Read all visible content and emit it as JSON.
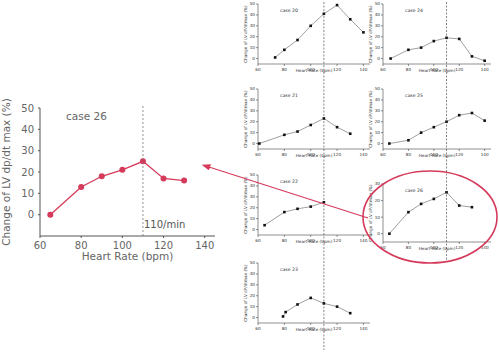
{
  "figure": {
    "accent_color": "#d63a5a",
    "small_chart_color": "#222222",
    "threshold_hr": 110
  },
  "chart_data": [
    {
      "id": "case26_large",
      "type": "line",
      "title": "case 26",
      "xlabel": "Heart Rate (bpm)",
      "ylabel": "Change of LV dp/dt max (%)",
      "xlim": [
        60,
        145
      ],
      "ylim": [
        -10,
        50
      ],
      "xticks": [
        60,
        80,
        100,
        120,
        140
      ],
      "yticks": [
        0,
        10,
        20,
        30,
        40,
        50
      ],
      "x": [
        65,
        80,
        90,
        100,
        110,
        120,
        130
      ],
      "values": [
        0,
        13,
        18,
        21,
        25,
        17,
        16
      ],
      "vline": 110,
      "annotation": "110/min",
      "grid": false,
      "color": "#d63a5a"
    },
    {
      "id": "case20",
      "type": "line",
      "title": "case 20",
      "xlabel": "Heart Rate (bpm)",
      "ylabel": "Change of LV dP/dtmax (%)",
      "xlim": [
        60,
        145
      ],
      "ylim": [
        -5,
        50
      ],
      "xticks": [
        60,
        80,
        100,
        120,
        140
      ],
      "yticks": [
        0,
        10,
        20,
        30,
        40,
        50
      ],
      "x": [
        73,
        80,
        90,
        100,
        110,
        120,
        130,
        140
      ],
      "values": [
        1,
        8,
        17,
        30,
        41,
        49,
        36,
        24
      ],
      "vline": 110
    },
    {
      "id": "case24",
      "type": "line",
      "title": "case 24",
      "xlabel": "Heart Rate (bpm)",
      "ylabel": "Change of LV dP/dtmax (%)",
      "xlim": [
        60,
        145
      ],
      "ylim": [
        -5,
        50
      ],
      "xticks": [
        60,
        80,
        100,
        120,
        140
      ],
      "yticks": [
        0,
        10,
        20,
        30,
        40,
        50
      ],
      "x": [
        66,
        80,
        90,
        100,
        110,
        120,
        130,
        140
      ],
      "values": [
        0,
        8,
        10,
        16,
        19,
        18,
        2,
        -2
      ],
      "vline": 110
    },
    {
      "id": "case21",
      "type": "line",
      "title": "case 21",
      "xlabel": "Heart Rate (bpm)",
      "ylabel": "Change of LV dP/dtmax (%)",
      "xlim": [
        60,
        145
      ],
      "ylim": [
        -5,
        50
      ],
      "xticks": [
        60,
        80,
        100,
        120,
        140
      ],
      "yticks": [
        0,
        10,
        20,
        30,
        40,
        50
      ],
      "x": [
        61,
        80,
        90,
        100,
        110,
        120,
        130
      ],
      "values": [
        0,
        8,
        11,
        17,
        23,
        15,
        9
      ],
      "vline": 110
    },
    {
      "id": "case25",
      "type": "line",
      "title": "case 25",
      "xlabel": "Heart Rate (bpm)",
      "ylabel": "Change of LV dP/dtmax (%)",
      "xlim": [
        60,
        145
      ],
      "ylim": [
        -5,
        50
      ],
      "xticks": [
        60,
        80,
        100,
        120,
        140
      ],
      "yticks": [
        0,
        10,
        20,
        30,
        40,
        50
      ],
      "x": [
        65,
        80,
        90,
        100,
        110,
        120,
        130,
        140
      ],
      "values": [
        0,
        3,
        10,
        15,
        20,
        26,
        28,
        21
      ],
      "vline": 110
    },
    {
      "id": "case22",
      "type": "line",
      "title": "case 22",
      "xlabel": "Heart Rate (bpm)",
      "ylabel": "Change of LV dP/dtmax (%)",
      "xlim": [
        60,
        145
      ],
      "ylim": [
        -5,
        50
      ],
      "xticks": [
        60,
        80,
        100,
        120,
        140
      ],
      "yticks": [
        0,
        10,
        20,
        30,
        40,
        50
      ],
      "x": [
        65,
        80,
        90,
        100,
        110
      ],
      "values": [
        4,
        16,
        19,
        21,
        25
      ],
      "vline": 110
    },
    {
      "id": "case26",
      "type": "line",
      "title": "case 26",
      "xlabel": "Heart Rate (bpm)",
      "ylabel": "Change of LV dP/dtmax (%)",
      "xlim": [
        60,
        145
      ],
      "ylim": [
        -5,
        30
      ],
      "xticks": [
        60,
        80,
        100,
        120,
        140
      ],
      "yticks": [
        0,
        10,
        20,
        30
      ],
      "x": [
        65,
        80,
        90,
        100,
        110,
        120,
        130
      ],
      "values": [
        0,
        13,
        18,
        21,
        25,
        17,
        16
      ],
      "vline": 110,
      "highlighted": true
    },
    {
      "id": "case23",
      "type": "line",
      "title": "case 23",
      "xlabel": "Heart Rate (bpm)",
      "ylabel": "Change of LV dP/dtmax (%)",
      "xlim": [
        60,
        145
      ],
      "ylim": [
        -5,
        50
      ],
      "xticks": [
        60,
        80,
        100,
        120,
        140
      ],
      "yticks": [
        0,
        10,
        20,
        30,
        40,
        50
      ],
      "x": [
        79,
        81,
        90,
        100,
        110,
        120,
        130
      ],
      "values": [
        1,
        5,
        12,
        18,
        13,
        10,
        4
      ],
      "vline": 110
    }
  ],
  "layout": {
    "large": {
      "left": 40,
      "top": 108,
      "width": 175,
      "height": 128,
      "label_color": "#666666"
    },
    "grid": [
      {
        "ref": 1,
        "left": 258,
        "top": 4,
        "width": 112,
        "height": 60
      },
      {
        "ref": 2,
        "left": 383,
        "top": 4,
        "width": 108,
        "height": 60
      },
      {
        "ref": 3,
        "left": 258,
        "top": 89,
        "width": 112,
        "height": 60
      },
      {
        "ref": 4,
        "left": 383,
        "top": 89,
        "width": 108,
        "height": 60
      },
      {
        "ref": 5,
        "left": 258,
        "top": 175,
        "width": 112,
        "height": 60
      },
      {
        "ref": 6,
        "left": 383,
        "top": 184,
        "width": 108,
        "height": 58
      },
      {
        "ref": 7,
        "left": 258,
        "top": 263,
        "width": 112,
        "height": 60
      }
    ],
    "arrow": {
      "x1": 368,
      "y1": 218,
      "x2": 209,
      "y2": 167
    },
    "ellipse": {
      "cx": 430,
      "cy": 217,
      "rx": 67,
      "ry": 46
    }
  }
}
